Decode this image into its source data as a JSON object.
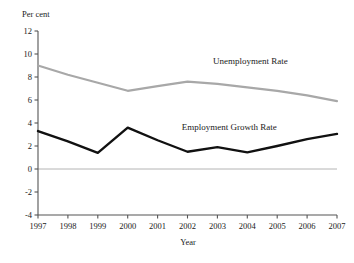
{
  "chart_data": {
    "type": "line",
    "title": "",
    "unit_label": "Per cent",
    "xlabel": "Year",
    "ylabel": "",
    "categories": [
      "1997",
      "1998",
      "1999",
      "2000",
      "2001",
      "2002",
      "2003",
      "2004",
      "2005",
      "2006",
      "2007"
    ],
    "x": [
      1997,
      1998,
      1999,
      2000,
      2001,
      2002,
      2003,
      2004,
      2005,
      2006,
      2007
    ],
    "ylim": [
      -4,
      12
    ],
    "yticks": [
      "12",
      "10",
      "8",
      "6",
      "4",
      "2",
      "0",
      "-2",
      "-4"
    ],
    "ytick_values": [
      12,
      10,
      8,
      6,
      4,
      2,
      0,
      -2,
      -4
    ],
    "grid": false,
    "zero_line": true,
    "legend_position": "inline-annotation",
    "series": [
      {
        "name": "Unemployment Rate",
        "color": "#a8a8a8",
        "label_x": 2004.1,
        "label_y": 9.1,
        "values": [
          9.0,
          8.2,
          7.5,
          6.8,
          7.2,
          7.6,
          7.4,
          7.1,
          6.8,
          6.4,
          5.9
        ]
      },
      {
        "name": "Employment Growth Rate",
        "color": "#111111",
        "label_x": 2003.4,
        "label_y": 3.4,
        "values": [
          3.3,
          2.4,
          1.4,
          3.6,
          2.5,
          1.5,
          1.9,
          1.45,
          2.0,
          2.6,
          3.05
        ]
      }
    ]
  },
  "labels": {
    "unit": "Per cent",
    "xaxis_title": "Year",
    "series_unemployment": "Unemployment Rate",
    "series_employment": "Employment Growth Rate"
  }
}
